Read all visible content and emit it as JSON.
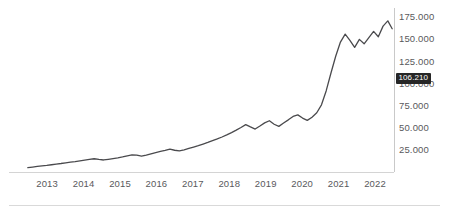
{
  "chart_data": {
    "type": "line",
    "title": "",
    "subtitle": "",
    "xlabel": "",
    "ylabel": "",
    "grid": false,
    "legend": "none",
    "xlim": [
      2012.5,
      2022.6
    ],
    "ylim": [
      0,
      182000
    ],
    "x_ticks": [
      "2013",
      "2014",
      "2015",
      "2016",
      "2017",
      "2018",
      "2019",
      "2020",
      "2021",
      "2022"
    ],
    "y_ticks": [
      "25.000",
      "50.000",
      "75.000",
      "100.000",
      "125.000",
      "150.000",
      "175.000"
    ],
    "y_tick_values": [
      25000,
      50000,
      75000,
      100000,
      125000,
      150000,
      175000
    ],
    "last_value_label": "106.210",
    "last_value": 106210,
    "line_color": "#4a4a4d",
    "axis_color": "#c9c9c9",
    "tick_label_color": "#59595c",
    "badge_bg": "#262626",
    "badge_text_color": "#ffffff",
    "series": [
      {
        "name": "index",
        "x": [
          2012.55,
          2012.68,
          2012.81,
          2012.94,
          2013.07,
          2013.2,
          2013.33,
          2013.46,
          2013.59,
          2013.72,
          2013.85,
          2013.98,
          2014.11,
          2014.24,
          2014.37,
          2014.5,
          2014.63,
          2014.76,
          2014.89,
          2015.02,
          2015.15,
          2015.28,
          2015.41,
          2015.54,
          2015.67,
          2015.8,
          2015.93,
          2016.06,
          2016.19,
          2016.32,
          2016.45,
          2016.58,
          2016.71,
          2016.84,
          2016.97,
          2017.1,
          2017.23,
          2017.36,
          2017.49,
          2017.62,
          2017.75,
          2017.88,
          2018.01,
          2018.14,
          2018.27,
          2018.4,
          2018.53,
          2018.66,
          2018.79,
          2018.92,
          2019.05,
          2019.18,
          2019.31,
          2019.44,
          2019.57,
          2019.7,
          2019.83,
          2019.96,
          2020.09,
          2020.22,
          2020.35,
          2020.48,
          2020.61,
          2020.74,
          2020.87,
          2021.0,
          2021.13,
          2021.26,
          2021.39,
          2021.52,
          2021.65,
          2021.78,
          2021.91,
          2022.04,
          2022.17,
          2022.3,
          2022.43,
          2022.55
        ],
        "values": [
          5000,
          5600,
          6300,
          6900,
          7400,
          8200,
          9000,
          9600,
          10400,
          11200,
          11800,
          12600,
          13500,
          14200,
          15000,
          14200,
          13600,
          14400,
          15200,
          16000,
          17000,
          18200,
          19400,
          19000,
          18000,
          19200,
          20600,
          22000,
          23200,
          24400,
          25800,
          24600,
          23800,
          25000,
          26600,
          28200,
          29800,
          31600,
          33400,
          35400,
          37400,
          39600,
          42000,
          44600,
          47400,
          50400,
          53600,
          51000,
          48600,
          52000,
          55600,
          58000,
          54000,
          51600,
          55400,
          59000,
          62800,
          64600,
          61000,
          58400,
          62000,
          67000,
          76000,
          92000,
          112000,
          131000,
          147000,
          156000,
          149000,
          141000,
          150000,
          145000,
          152000,
          159000,
          153000,
          165000,
          171000,
          162000
        ]
      }
    ]
  },
  "axes": {
    "y_axis_line": true,
    "x_axis_line": true
  },
  "footer": {
    "divider": true
  }
}
